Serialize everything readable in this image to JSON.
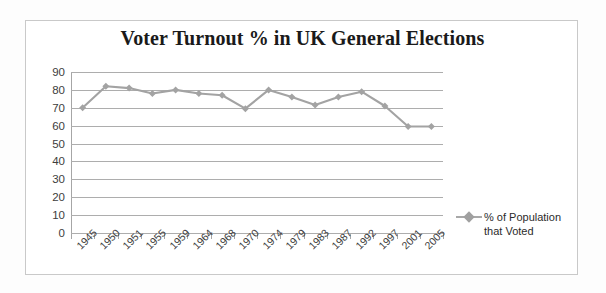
{
  "chart_data": {
    "type": "line",
    "title": "Voter Turnout % in UK General Elections",
    "xlabel": "",
    "ylabel": "",
    "ylim": [
      0,
      90
    ],
    "ytick_step": 10,
    "yticks": [
      "90",
      "80",
      "70",
      "60",
      "50",
      "40",
      "30",
      "20",
      "10",
      "0"
    ],
    "grid": true,
    "legend_position": "right",
    "series_color": "#a3a3a3",
    "marker": "diamond",
    "categories": [
      "1945",
      "1950",
      "1951",
      "1955",
      "1959",
      "1964",
      "1968",
      "1970",
      "1974",
      "1979",
      "1983",
      "1987",
      "1992",
      "1997",
      "2001",
      "2005"
    ],
    "series": [
      {
        "name": "% of Population that Voted",
        "values": [
          70,
          82,
          81,
          78,
          80,
          78,
          77,
          69.5,
          80,
          76,
          71.5,
          76,
          79,
          71,
          59.5,
          59.5
        ]
      }
    ],
    "legend": [
      {
        "line1": "% of Population",
        "line2": "that Voted"
      }
    ]
  },
  "colors": {
    "series": "#a3a3a3",
    "gridline": "#adadad",
    "axis": "#a6a6a6",
    "frame_border": "#c9c9c9",
    "title_text": "#1a1a1a",
    "tick_text": "#3d3d3d"
  }
}
